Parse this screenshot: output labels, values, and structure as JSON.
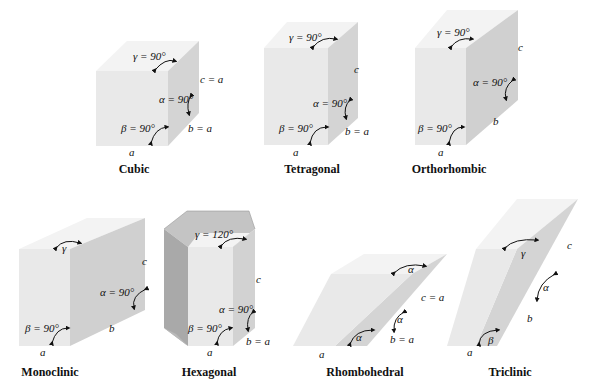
{
  "figure": {
    "colors": {
      "front_face": "#e9e9e9",
      "top_face": "#f3f3f3",
      "side_face": "#d2d2d2",
      "hex_dark": "#a9a9a9",
      "hex_mid": "#c4c4c4",
      "text": "#111111"
    },
    "systems": [
      {
        "name": "Cubic",
        "gamma": "γ = 90°",
        "alpha": "α = 90°",
        "beta": "β = 90°",
        "a": "a",
        "b": "b = a",
        "c": "c = a"
      },
      {
        "name": "Tetragonal",
        "gamma": "γ = 90°",
        "alpha": "α = 90°",
        "beta": "β = 90°",
        "a": "a",
        "b": "b = a",
        "c": "c"
      },
      {
        "name": "Orthorhombic",
        "gamma": "γ = 90°",
        "alpha": "α = 90°",
        "beta": "β = 90°",
        "a": "a",
        "b": "b",
        "c": "c"
      },
      {
        "name": "Monoclinic",
        "gamma": "γ",
        "alpha": "α = 90°",
        "beta": "β = 90°",
        "a": "a",
        "b": "b",
        "c": "c"
      },
      {
        "name": "Hexagonal",
        "gamma": "γ = 120°",
        "alpha": "α = 90°",
        "beta": "β = 90°",
        "a": "a",
        "b": "b = a",
        "c": "c"
      },
      {
        "name": "Rhombohedral",
        "gamma": "α",
        "alpha": "α",
        "beta": "α",
        "a": "a",
        "b": "b = a",
        "c": "c = a"
      },
      {
        "name": "Triclinic",
        "gamma": "γ",
        "alpha": "α",
        "beta": "β",
        "a": "a",
        "b": "b",
        "c": "c"
      }
    ]
  }
}
